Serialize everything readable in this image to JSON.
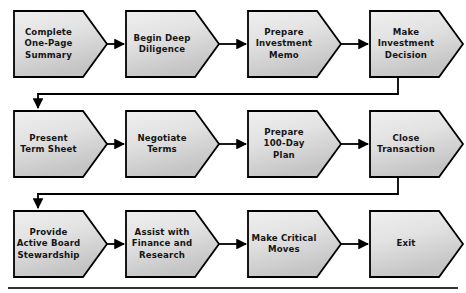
{
  "diagram": {
    "type": "process-flowchart",
    "orientation": "left-to-right, wrapping across three rows",
    "shape": "chevron",
    "colors": {
      "node_fill_light": "#ebebeb",
      "node_fill_dark": "#c9c9c9",
      "node_stroke": "#000000",
      "connector": "#000000",
      "background": "#ffffff",
      "text": "#161616",
      "footer_rule": "#333333"
    },
    "rows": [
      {
        "index": 1,
        "nodes": [
          {
            "id": "n1",
            "label": "Complete\nOne-Page\nSummary"
          },
          {
            "id": "n2",
            "label": "Begin Deep\nDiligence"
          },
          {
            "id": "n3",
            "label": "Prepare\nInvestment\nMemo"
          },
          {
            "id": "n4",
            "label": "Make\nInvestment\nDecision"
          }
        ]
      },
      {
        "index": 2,
        "nodes": [
          {
            "id": "n5",
            "label": "Present\nTerm Sheet"
          },
          {
            "id": "n6",
            "label": "Negotiate\nTerms"
          },
          {
            "id": "n7",
            "label": "Prepare\n100-Day\nPlan"
          },
          {
            "id": "n8",
            "label": "Close\nTransaction"
          }
        ]
      },
      {
        "index": 3,
        "nodes": [
          {
            "id": "n9",
            "label": "Provide\nActive Board\nStewardship"
          },
          {
            "id": "n10",
            "label": "Assist with\nFinance and\nResearch"
          },
          {
            "id": "n11",
            "label": "Make Critical\nMoves"
          },
          {
            "id": "n12",
            "label": "Exit"
          }
        ]
      }
    ],
    "connectors": [
      {
        "id": "c1",
        "from": "n1",
        "to": "n2",
        "kind": "arrow-right"
      },
      {
        "id": "c2",
        "from": "n2",
        "to": "n3",
        "kind": "arrow-right"
      },
      {
        "id": "c3",
        "from": "n3",
        "to": "n4",
        "kind": "arrow-right"
      },
      {
        "id": "c4",
        "from": "n4",
        "to": "n5",
        "kind": "wrap-down-left"
      },
      {
        "id": "c5",
        "from": "n5",
        "to": "n6",
        "kind": "arrow-right"
      },
      {
        "id": "c6",
        "from": "n6",
        "to": "n7",
        "kind": "arrow-right"
      },
      {
        "id": "c7",
        "from": "n7",
        "to": "n8",
        "kind": "arrow-right"
      },
      {
        "id": "c8",
        "from": "n8",
        "to": "n9",
        "kind": "wrap-down-left"
      },
      {
        "id": "c9",
        "from": "n9",
        "to": "n10",
        "kind": "arrow-right"
      },
      {
        "id": "c10",
        "from": "n10",
        "to": "n11",
        "kind": "arrow-right"
      },
      {
        "id": "c11",
        "from": "n11",
        "to": "n12",
        "kind": "arrow-right"
      }
    ],
    "footer_rule": {
      "visible": true
    }
  }
}
